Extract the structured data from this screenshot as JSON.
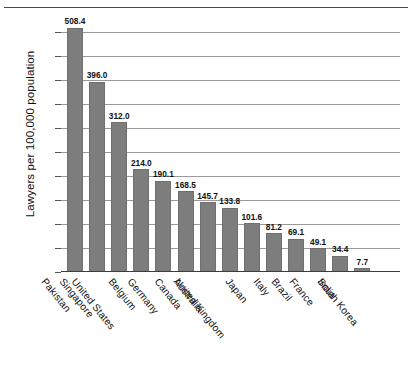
{
  "chart_data": {
    "type": "bar",
    "title": "",
    "xlabel": "",
    "ylabel": "Lawyers per 100,000 population",
    "ylim": [
      0,
      525
    ],
    "yticks": [
      0,
      50,
      100,
      150,
      200,
      250,
      300,
      350,
      400,
      450,
      500
    ],
    "grid": true,
    "legend": "none",
    "bar_color": "#7d7d7d",
    "categories": [
      "Pakistan",
      "Singapore",
      "United States",
      "Belgium",
      "Germany",
      "Canada",
      "Australia",
      "United Kingdom",
      "Japan",
      "Italy",
      "Brazil",
      "France",
      "India",
      "South Korea"
    ],
    "values": [
      508.4,
      396.0,
      312.0,
      214.0,
      190.1,
      168.5,
      145.7,
      133.8,
      101.6,
      81.2,
      69.1,
      49.1,
      34.4,
      7.7
    ],
    "data_labels": [
      "508.4",
      "396.0",
      "312.0",
      "214.0",
      "190.1",
      "168.5",
      "145.7",
      "133.8",
      "101.6",
      "81.2",
      "69.1",
      "49.1",
      "34.4",
      "7.7"
    ],
    "ytick_labels": [
      "0",
      "50",
      "100",
      "150",
      "200",
      "250",
      "300",
      "350",
      "400",
      "450",
      "500"
    ]
  }
}
